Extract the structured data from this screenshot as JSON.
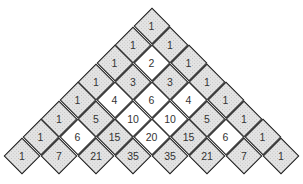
{
  "diagram": {
    "type": "pascals-triangle",
    "shading_rule": "odd values shaded grey, even values white",
    "colors": {
      "odd_fill": "#e4e4e4",
      "even_fill": "#ffffff",
      "border": "#1a1a1a",
      "text": "#333333"
    },
    "rows": [
      [
        1
      ],
      [
        1,
        1
      ],
      [
        1,
        2,
        1
      ],
      [
        1,
        3,
        3,
        1
      ],
      [
        1,
        4,
        6,
        4,
        1
      ],
      [
        1,
        5,
        10,
        10,
        5,
        1
      ],
      [
        1,
        6,
        15,
        20,
        15,
        6,
        1
      ],
      [
        1,
        7,
        21,
        35,
        35,
        21,
        7,
        1
      ]
    ]
  }
}
